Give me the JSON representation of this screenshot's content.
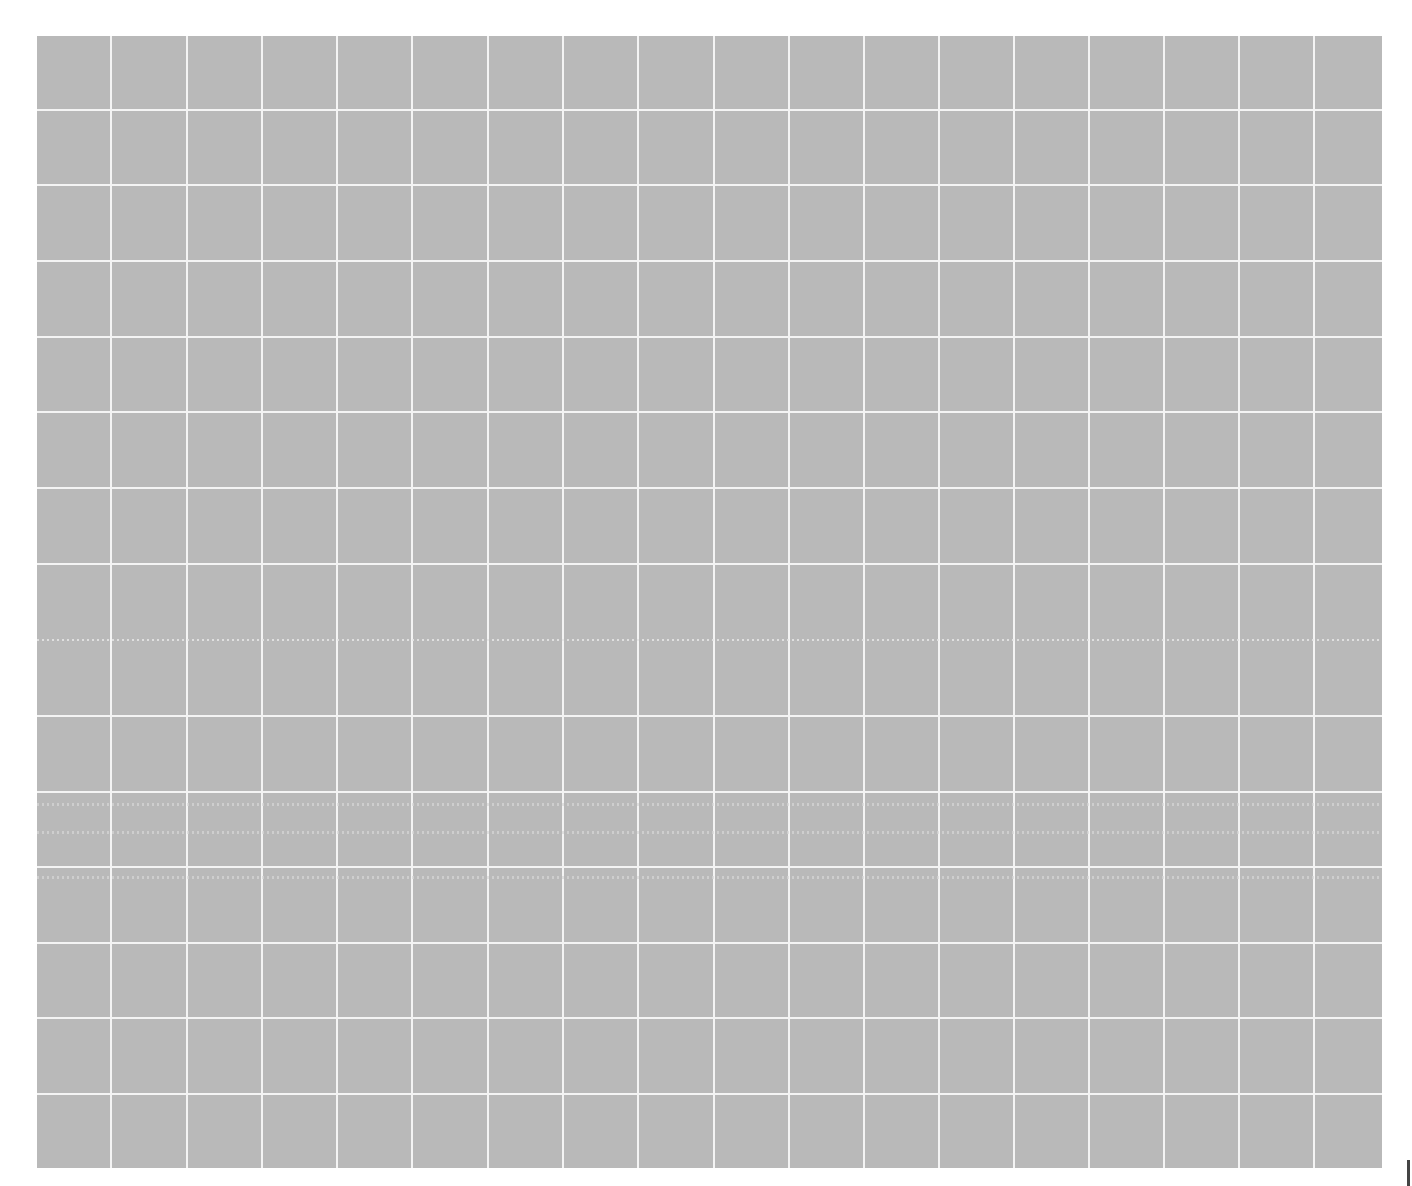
{
  "canvas": {
    "background": "#ffffff",
    "grid_fill": "#b9b9b9",
    "grid_line_color": "#f4f4f4",
    "grid_bounds": {
      "left": 37,
      "top": 36,
      "right": 1382,
      "bottom": 1168
    },
    "vertical_lines_x": [
      111,
      187,
      262,
      337,
      412,
      488,
      563,
      638,
      714,
      789,
      864,
      939,
      1014,
      1089,
      1164,
      1239,
      1314
    ],
    "horizontal_lines_y": [
      110,
      185,
      261,
      337,
      412,
      488,
      564,
      716,
      792,
      867,
      943,
      1018,
      1094
    ],
    "dotted_lines_y": [
      640,
      804,
      832,
      877
    ]
  }
}
